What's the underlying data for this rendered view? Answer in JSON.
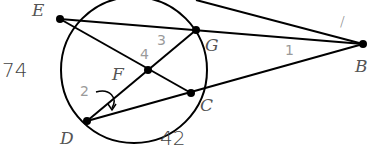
{
  "diagram": {
    "points": {
      "E": {
        "label": "E",
        "x": 60,
        "y": 19
      },
      "G": {
        "label": "G",
        "x": 196,
        "y": 30
      },
      "F": {
        "label": "F",
        "x": 148,
        "y": 70
      },
      "C": {
        "label": "C",
        "x": 191,
        "y": 93
      },
      "D": {
        "label": "D",
        "x": 87,
        "y": 121
      },
      "B": {
        "label": "B",
        "x": 363,
        "y": 44
      }
    },
    "angle_labels": {
      "a1": "1",
      "a2": "2",
      "a3": "3",
      "a4": "4"
    },
    "handwritten": {
      "arc_ED": "74",
      "arc_DC": "42",
      "tick": "/"
    },
    "colors": {
      "stroke": "#000000",
      "label": "#555555",
      "angle_label": "#9a9a9a"
    }
  }
}
